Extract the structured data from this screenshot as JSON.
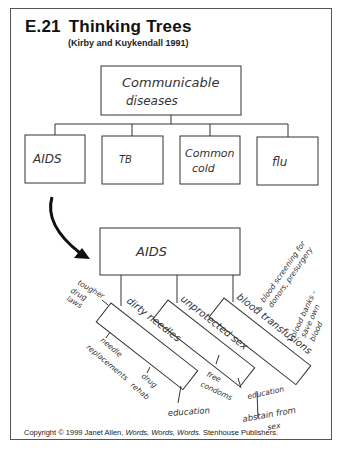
{
  "header": {
    "number": "E.21",
    "title": "Thinking Trees",
    "subtitle": "(Kirby and Kuykendall 1991)"
  },
  "tree1": {
    "root": [
      "Communicable",
      "diseases"
    ],
    "children": [
      {
        "label": [
          "AIDS"
        ]
      },
      {
        "label": [
          "TB"
        ]
      },
      {
        "label": [
          "Common",
          "cold"
        ]
      },
      {
        "label": [
          "flu"
        ]
      }
    ]
  },
  "tree2": {
    "root": "AIDS",
    "branches": [
      {
        "label": "dirty needles",
        "details": [
          "tougher",
          "drug",
          "laws"
        ],
        "details2": [
          "needle",
          "replacements"
        ],
        "details3": [
          "drug",
          "rehab"
        ],
        "details4": "education"
      },
      {
        "label": "unprotected sex",
        "details": [
          "free",
          "condoms"
        ],
        "details2": "education",
        "details3": [
          "abstain from",
          "sex"
        ]
      },
      {
        "label": "blood transfusions",
        "details": [
          "blood screening for",
          "donors, presurgery"
        ],
        "details2": [
          "blood banks -",
          "save own",
          "blood"
        ],
        "details3": "education"
      }
    ]
  },
  "footer": {
    "prefix": "Copyright © 1999 Janet Allen, ",
    "italic": "Words, Words, Words.",
    "suffix": " Stenhouse Publishers."
  }
}
